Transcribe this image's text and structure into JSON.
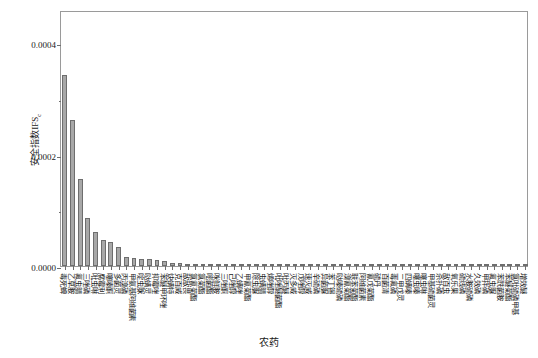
{
  "chart_data": {
    "type": "bar",
    "title": "",
    "xlabel": "农药",
    "ylabel": "安全指数IFS",
    "ylabel_subscript": "c",
    "ylim": [
      0,
      0.00046
    ],
    "yticks": [
      0.0,
      0.0002,
      0.0004
    ],
    "ytick_labels": [
      "0.0000",
      "0.0002",
      "0.0004"
    ],
    "yminor_ticks": [
      0.0001,
      0.0003
    ],
    "grid": false,
    "legend": null,
    "bar_color": "#a8a8a8",
    "bar_edge_color": "#6e6e6e",
    "categories": [
      "毒死蜱",
      "乙草胺",
      "氟虫腈",
      "三唑磷",
      "吡虫啉",
      "腐霉利",
      "噻嗪酮",
      "多菌灵",
      "丙溴磷",
      "甲氨基阿维菌素",
      "啶虫脒",
      "哒螨灵",
      "抑霉唑",
      "苯醚甲环唑",
      "炔螨特",
      "克百威",
      "敌敌畏",
      "氯氰菊酯",
      "氯菊酯",
      "嘧菌酯",
      "咪鲜胺",
      "三唑酮",
      "己唑醇",
      "乙螨唑",
      "甲氰菊酯",
      "除虫脲",
      "虫螨腈",
      "烯唑醇",
      "吡唑醚菌酯",
      "吡丙醚",
      "灭多威",
      "戊唑醇",
      "速灭威",
      "辛硫磷",
      "异菌脲",
      "苯丁锡",
      "哒嗪硫磷",
      "溴氰菊酯",
      "联苯菊酯",
      "阿维菌素",
      "氰戊菊酯",
      "硫丹",
      "百菌清",
      "毒氟磷",
      "二甲戊灵",
      "四螨嗪",
      "噻虫嗪",
      "噻虫啉",
      "甲基硫菌灵",
      "杀扑磷",
      "敌百虫",
      "氧乐果",
      "硫线磷",
      "水胺硫磷",
      "久效磷",
      "甲拌磷",
      "氟虫脲",
      "苯酰菌胺",
      "苯醚菊酯",
      "氯吡硫磷甲基",
      "增效醚"
    ],
    "values": [
      0.000343,
      0.000262,
      0.000157,
      8.55e-05,
      6.13e-05,
      4.7e-05,
      4.32e-05,
      3.47e-05,
      1.56e-05,
      1.38e-05,
      1.35e-05,
      1.28e-05,
      1.05e-05,
      8.5e-06,
      5.6e-06,
      4.6e-06,
      3.6e-06,
      3e-06,
      2.7e-06,
      2.4e-06,
      2.1e-06,
      1.9e-06,
      1.7e-06,
      1.5e-06,
      1.3e-06,
      1.2e-06,
      1.1e-06,
      1e-06,
      9.4e-07,
      8.8e-07,
      8.2e-07,
      7.6e-07,
      7e-07,
      6.4e-07,
      5.8e-07,
      5.2e-07,
      4.7e-07,
      4.2e-07,
      3.8e-07,
      3.4e-07,
      3e-07,
      2.7e-07,
      2.4e-07,
      2.1e-07,
      1.9e-07,
      1.7e-07,
      1.5e-07,
      1.3e-07,
      1.1e-07,
      1e-07,
      9e-08,
      8e-08,
      7e-08,
      6e-08,
      5e-08,
      4e-08,
      4e-08,
      3e-08,
      3e-08,
      2e-08,
      2e-08
    ]
  }
}
